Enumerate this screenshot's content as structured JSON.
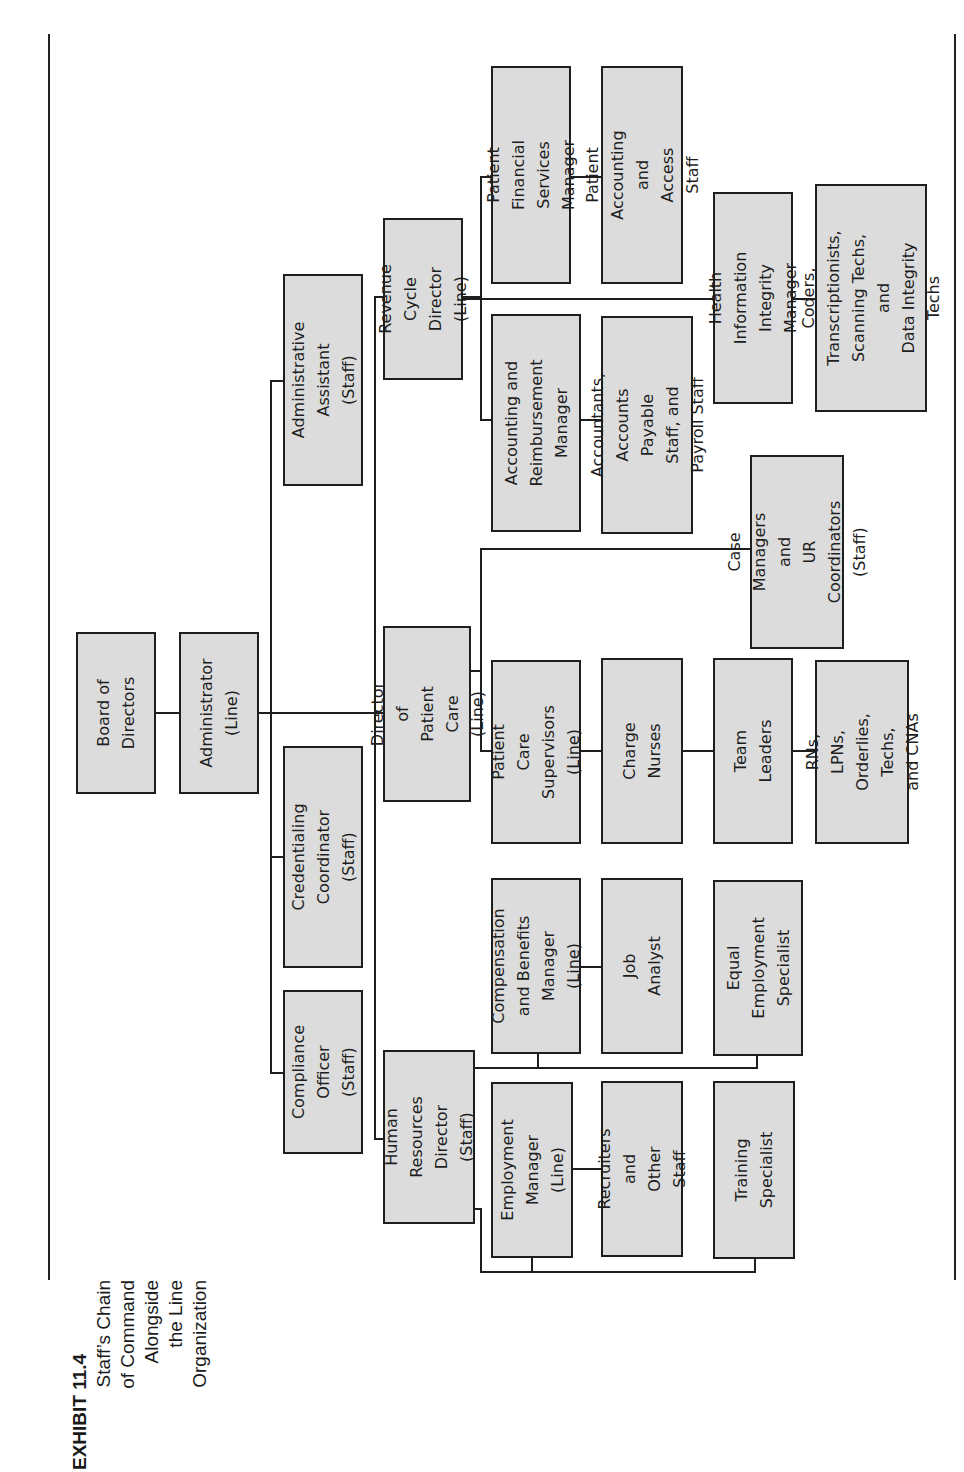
{
  "exhibit": {
    "title": "EXHIBIT 11.4",
    "subtitle_lines": [
      "Staff’s Chain",
      "of Command",
      "Alongside",
      "the Line",
      "Organization"
    ]
  },
  "chart_orientation": "rotated 90° counter-clockwise; hierarchy flows left-to-right on page",
  "nodes": {
    "board": "Board of\nDirectors",
    "administrator": "Administrator\n(Line)",
    "admin_assistant": "Administrative\nAssistant (Staff)",
    "credentialing": "Credentialing\nCoordinator (Staff)",
    "compliance": "Compliance\nOfficer (Staff)",
    "revenue_cycle": "Revenue Cycle\nDirector (Line)",
    "patient_care_dir": "Director of\nPatient Care\n(Line)",
    "hr_director": "Human\nResources\nDirector (Staff)",
    "pfs_manager": "Patient Financial\nServices Manager",
    "pa_staff": "Patient Accounting\nand Access Staff",
    "acct_reimb_mgr": "Accounting and\nReimbursement\nManager",
    "accountants": "Accountants,\nAccounts Payable\nStaff, and Payroll Staff",
    "him_manager": "Health Information\nIntegrity Manager",
    "coders": "Coders,\nTranscriptionists,\nScanning Techs, and\nData Integrity Techs",
    "case_managers": "Case Managers and\nUR Coordinators\n(Staff)",
    "pc_supervisors": "Patient Care\nSupervisors\n(Line)",
    "charge_nurses": "Charge Nurses",
    "team_leaders": "Team Leaders",
    "rns": "RNs, LPNs,\nOrderlies,\nTechs, and CNAs",
    "comp_benefits": "Compensation\nand Benefits\nManager (Line)",
    "job_analyst": "Job Analyst",
    "equal_employment": "Equal\nEmployment\nSpecialist",
    "employment_mgr": "Employment\nManager (Line)",
    "recruiters": "Recruiters and\nOther Staff",
    "training": "Training\nSpecialist"
  },
  "hierarchy": [
    {
      "parent": "Board of Directors",
      "children": [
        "Administrator (Line)"
      ]
    },
    {
      "parent": "Administrator (Line)",
      "children": [
        "Administrative Assistant (Staff)",
        "Credentialing Coordinator (Staff)",
        "Compliance Officer (Staff)",
        "Revenue Cycle Director (Line)",
        "Director of Patient Care (Line)",
        "Human Resources Director (Staff)"
      ]
    },
    {
      "parent": "Revenue Cycle Director (Line)",
      "children": [
        "Patient Financial Services Manager",
        "Accounting and Reimbursement Manager",
        "Health Information Integrity Manager"
      ]
    },
    {
      "parent": "Patient Financial Services Manager",
      "children": [
        "Patient Accounting and Access Staff"
      ]
    },
    {
      "parent": "Accounting and Reimbursement Manager",
      "children": [
        "Accountants, Accounts Payable Staff, and Payroll Staff"
      ]
    },
    {
      "parent": "Health Information Integrity Manager",
      "children": [
        "Coders, Transcriptionists, Scanning Techs, and Data Integrity Techs"
      ]
    },
    {
      "parent": "Director of Patient Care (Line)",
      "children": [
        "Patient Care Supervisors (Line)",
        "Case Managers and UR Coordinators (Staff)"
      ]
    },
    {
      "parent": "Patient Care Supervisors (Line)",
      "children": [
        "Charge Nurses"
      ]
    },
    {
      "parent": "Charge Nurses",
      "children": [
        "Team Leaders"
      ]
    },
    {
      "parent": "Team Leaders",
      "children": [
        "RNs, LPNs, Orderlies, Techs, and CNAs"
      ]
    },
    {
      "parent": "Human Resources Director (Staff)",
      "children": [
        "Compensation and Benefits Manager (Line)",
        "Equal Employment Specialist",
        "Employment Manager (Line)",
        "Training Specialist"
      ]
    },
    {
      "parent": "Compensation and Benefits Manager (Line)",
      "children": [
        "Job Analyst"
      ]
    },
    {
      "parent": "Employment Manager (Line)",
      "children": [
        "Recruiters and Other Staff"
      ]
    }
  ],
  "colors": {
    "box_fill": "#dcdcdc",
    "box_border": "#1e1e1e",
    "connector": "#1e1e1e",
    "background": "#ffffff"
  }
}
